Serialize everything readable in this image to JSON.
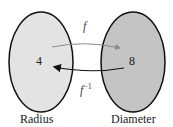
{
  "diagram": {
    "left_set": {
      "label": "Radius",
      "value": "4",
      "fill": "#e3e3e3"
    },
    "right_set": {
      "label": "Diameter",
      "value": "8",
      "fill": "#c4c4c4"
    },
    "forward_arrow": {
      "label": "f",
      "direction": "Radius to Diameter",
      "color": "#8a8a8a"
    },
    "inverse_arrow": {
      "label": "f",
      "superscript": "−1",
      "direction": "Diameter to Radius",
      "color": "#111111"
    }
  }
}
